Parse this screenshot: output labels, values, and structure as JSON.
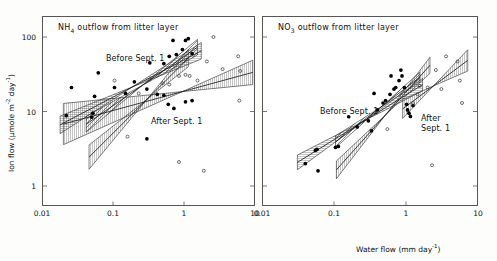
{
  "figure": {
    "background": "#ffffff",
    "axis_color": "#555555",
    "marker_filled_color": "#000000",
    "marker_open_color": "#000000"
  },
  "axes": {
    "x_title_text": "Water flow  (mm day",
    "x_title_exp": "-1",
    "x_title_close": ")",
    "y_title_a": "Ion flow  (",
    "y_title_mu": "µmole m",
    "y_title_exp1": "-2",
    "y_title_day": " day",
    "y_title_exp2": "-1",
    "y_title_close": ")",
    "x_ticks": [
      "0.01",
      "0.1",
      "1",
      "10"
    ],
    "y_ticks": [
      "100",
      "10",
      "1"
    ],
    "xlim": [
      0.01,
      10
    ],
    "ylim": [
      0.7,
      200
    ],
    "xlog": true,
    "ylog": true
  },
  "panels": [
    {
      "id": "left",
      "title_main": "NH",
      "title_sub": "4",
      "title_rest": " outflow from litter layer",
      "annotations": [
        {
          "name": "before-sept-label",
          "text": "Before Sept. 1",
          "x": 106,
          "y": 54
        },
        {
          "name": "after-sept-label",
          "text": "After Sept. 1",
          "x": 151,
          "y": 117
        }
      ]
    },
    {
      "id": "right",
      "title_main": "NO",
      "title_sub": "3",
      "title_rest": " outflow from litter layer",
      "annotations": [
        {
          "name": "before-sept-label",
          "text": "Before Sept. 1",
          "x": 320,
          "y": 107
        },
        {
          "name": "after-sept-label-1",
          "text": "After",
          "x": 421,
          "y": 114
        },
        {
          "name": "after-sept-label-2",
          "text": "Sept. 1",
          "x": 421,
          "y": 124
        }
      ]
    }
  ],
  "chart_data": {
    "type": "scatter",
    "xlabel": "Water flow (mm day^-1)",
    "ylabel": "Ion flow (umole m^-2 day^-1)",
    "xlog": true,
    "ylog": true,
    "xlim": [
      0.01,
      10
    ],
    "ylim": [
      0.7,
      200
    ],
    "grid": false,
    "legend": "inline annotations",
    "panels": [
      {
        "name": "NH4 outflow from litter layer",
        "series": [
          {
            "name": "Before Sept. 1",
            "marker": "filled-circle",
            "points": [
              [
                0.022,
                8.8
              ],
              [
                0.026,
                21.0
              ],
              [
                0.05,
                8.4
              ],
              [
                0.052,
                9.5
              ],
              [
                0.055,
                16.0
              ],
              [
                0.062,
                33.0
              ],
              [
                0.105,
                21.0
              ],
              [
                0.15,
                17.5
              ],
              [
                0.2,
                25.0
              ],
              [
                0.3,
                20.0
              ],
              [
                0.33,
                45.0
              ],
              [
                0.42,
                17.0
              ],
              [
                0.52,
                44.0
              ],
              [
                0.62,
                55.0
              ],
              [
                0.7,
                90.0
              ],
              [
                0.78,
                58.0
              ],
              [
                0.95,
                68.0
              ],
              [
                1.05,
                90.0
              ],
              [
                1.15,
                95.0
              ],
              [
                1.3,
                60.0
              ],
              [
                0.6,
                12.5
              ],
              [
                0.72,
                11.0
              ],
              [
                0.3,
                4.3
              ],
              [
                1.05,
                13.5
              ],
              [
                1.3,
                14.0
              ],
              [
                0.52,
                16.5
              ]
            ]
          },
          {
            "name": "After Sept. 1",
            "marker": "open-circle",
            "points": [
              [
                0.105,
                26.0
              ],
              [
                0.23,
                17.5
              ],
              [
                0.33,
                27.0
              ],
              [
                0.5,
                24.0
              ],
              [
                0.62,
                23.0
              ],
              [
                0.85,
                30.0
              ],
              [
                1.05,
                31.0
              ],
              [
                1.2,
                30.0
              ],
              [
                1.55,
                26.0
              ],
              [
                2.1,
                47.0
              ],
              [
                2.6,
                100.0
              ],
              [
                3.5,
                37.0
              ],
              [
                5.8,
                55.0
              ],
              [
                6.0,
                14.0
              ],
              [
                6.2,
                35.0
              ],
              [
                0.16,
                4.6
              ],
              [
                0.85,
                2.1
              ],
              [
                1.9,
                1.6
              ]
            ]
          }
        ],
        "fitted_bands": [
          {
            "name": "before-sept-band",
            "hatch": "horizontal",
            "slope": 0.5,
            "x0": 0.018,
            "x1": 1.6
          },
          {
            "name": "before-sept-band-2",
            "hatch": "diagonal",
            "slope": 0.62,
            "x0": 0.04,
            "x1": 1.5
          },
          {
            "name": "after-sept-band",
            "hatch": "vertical",
            "slope": 0.28,
            "x0": 0.02,
            "x1": 9.0
          },
          {
            "name": "after-sept-band-2",
            "hatch": "vertical",
            "slope": 0.95,
            "x0": 0.045,
            "x1": 1.1
          }
        ]
      },
      {
        "name": "NO3 outflow from litter layer",
        "series": [
          {
            "name": "Before Sept. 1",
            "marker": "filled-circle",
            "points": [
              [
                0.04,
                2.0
              ],
              [
                0.055,
                3.0
              ],
              [
                0.058,
                3.1
              ],
              [
                0.06,
                1.6
              ],
              [
                0.105,
                3.3
              ],
              [
                0.115,
                3.4
              ],
              [
                0.16,
                8.5
              ],
              [
                0.21,
                6.2
              ],
              [
                0.3,
                7.5
              ],
              [
                0.33,
                5.5
              ],
              [
                0.4,
                10.5
              ],
              [
                0.48,
                13.0
              ],
              [
                0.52,
                14.0
              ],
              [
                0.6,
                17.0
              ],
              [
                0.68,
                20.0
              ],
              [
                0.72,
                21.0
              ],
              [
                0.8,
                26.0
              ],
              [
                0.88,
                30.0
              ],
              [
                0.95,
                21.0
              ],
              [
                1.02,
                12.5
              ],
              [
                1.05,
                10.5
              ],
              [
                1.1,
                9.5
              ],
              [
                1.15,
                8.6
              ],
              [
                1.25,
                12.0
              ],
              [
                0.36,
                17.5
              ],
              [
                0.62,
                30.0
              ],
              [
                0.85,
                36.0
              ]
            ]
          },
          {
            "name": "After Sept. 1",
            "marker": "open-circle",
            "points": [
              [
                0.55,
                5.8
              ],
              [
                1.25,
                13.0
              ],
              [
                1.45,
                17.0
              ],
              [
                1.55,
                22.0
              ],
              [
                2.0,
                21.0
              ],
              [
                2.6,
                36.0
              ],
              [
                3.1,
                20.0
              ],
              [
                3.6,
                55.0
              ],
              [
                5.2,
                47.0
              ],
              [
                5.6,
                26.0
              ],
              [
                6.0,
                13.0
              ],
              [
                2.3,
                1.9
              ]
            ]
          }
        ],
        "fitted_bands": [
          {
            "name": "before-sept-band",
            "hatch": "horizontal",
            "slope": 0.6,
            "x0": 0.032,
            "x1": 1.6
          },
          {
            "name": "before-sept-band-2",
            "hatch": "diagonal",
            "slope": 0.72,
            "x0": 0.1,
            "x1": 1.5
          },
          {
            "name": "after-sept-band",
            "hatch": "vertical",
            "slope": 1.05,
            "x0": 0.11,
            "x1": 2.0
          },
          {
            "name": "after-sept-band-2",
            "hatch": "vertical",
            "slope": 0.75,
            "x0": 0.9,
            "x1": 7.0
          }
        ]
      }
    ]
  }
}
